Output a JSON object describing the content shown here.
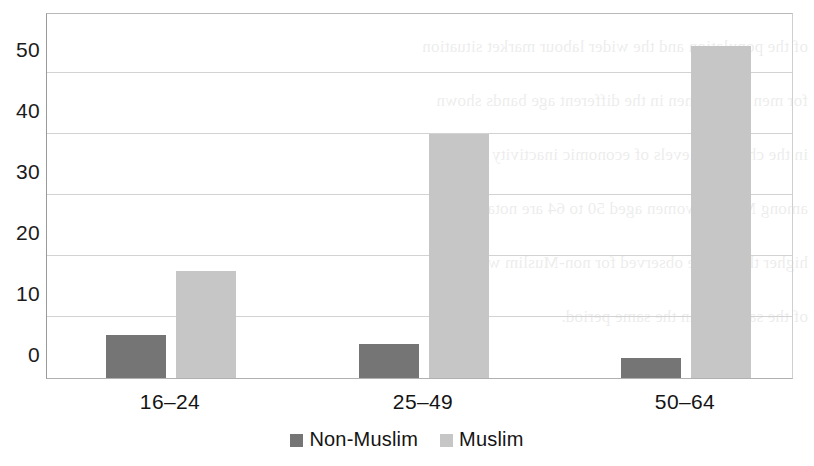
{
  "chart_data": {
    "type": "bar",
    "title": "",
    "subtitle": "",
    "xlabel": "",
    "ylabel": "",
    "categories": [
      "16–24",
      "25–49",
      "50–64"
    ],
    "series": [
      {
        "name": "Non-Muslim",
        "color": "#757575",
        "values": [
          7.0,
          5.5,
          3.3
        ]
      },
      {
        "name": "Muslim",
        "color": "#c6c6c6",
        "values": [
          17.5,
          40.0,
          54.5
        ]
      }
    ],
    "ylim": [
      0,
      60
    ],
    "yticks": [
      0,
      10,
      20,
      30,
      40,
      50,
      60
    ],
    "ytick_labels": [
      "0",
      "10",
      "20",
      "30",
      "40",
      "50",
      "60"
    ],
    "grid": true,
    "grid_axis": "y",
    "legend_position": "bottom"
  },
  "legend": {
    "items": [
      {
        "label": "Non-Muslim",
        "swatch": "legend-swatch-non-muslim"
      },
      {
        "label": "Muslim",
        "swatch": "legend-swatch-muslim"
      }
    ]
  },
  "background_text": {
    "lines": [
      "of the population and the wider labour market situation",
      "for men and women in the different age bands shown",
      "in the chart, the levels of economic inactivity",
      "among Muslim women aged 50 to 64 are notably",
      "higher than those observed for non-Muslim women",
      "of the same age in the same period."
    ]
  }
}
